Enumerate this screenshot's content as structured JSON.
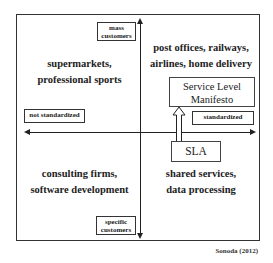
{
  "diagram": {
    "type": "quadrant-matrix",
    "axes": {
      "vertical": {
        "top_label": "mass customers",
        "bottom_label": "specific customers"
      },
      "horizontal": {
        "left_label": "not standardized",
        "right_label": "standardized"
      }
    },
    "labels": {
      "mass": "mass",
      "customers_top": "customers",
      "specific": "specific",
      "customers_bottom": "customers",
      "not_standardized": "not standardized",
      "standardized": "standardized"
    },
    "quadrants": {
      "top_left": {
        "line1": "supermarkets,",
        "line2": "professional sports"
      },
      "top_right": {
        "line1": "post offices, railways,",
        "line2": "airlines, home delivery"
      },
      "bottom_left": {
        "line1": "consulting firms,",
        "line2": "software development"
      },
      "bottom_right": {
        "line1": "shared services,",
        "line2": "data processing"
      }
    },
    "boxes": {
      "service_level_manifesto": {
        "line1": "Service Level",
        "line2": "Manifesto"
      },
      "sla": "SLA"
    },
    "transition_arrow": {
      "from": "SLA",
      "to": "Service Level Manifesto"
    },
    "source": "Sonoda (2012)"
  }
}
